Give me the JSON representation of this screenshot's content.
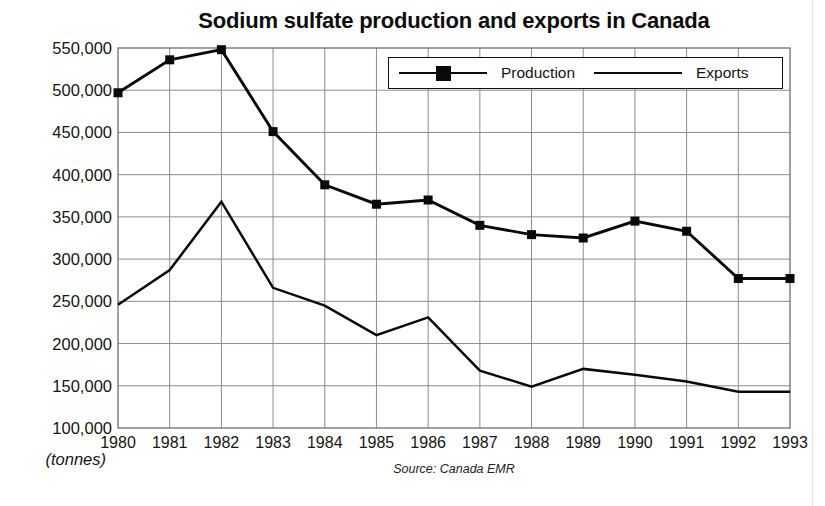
{
  "chart_data": {
    "type": "line",
    "title": "Sodium sulfate production and exports in Canada",
    "xlabel": "",
    "ylabel": "(tonnes)",
    "ylim": [
      100000,
      550000
    ],
    "ytick_step": 50000,
    "grid": true,
    "legend_position": "top-right-inside",
    "source": "Source: Canada EMR",
    "categories": [
      "1980",
      "1981",
      "1982",
      "1983",
      "1984",
      "1985",
      "1986",
      "1987",
      "1988",
      "1989",
      "1990",
      "1991",
      "1992",
      "1993"
    ],
    "x": [
      1980,
      1981,
      1982,
      1983,
      1984,
      1985,
      1986,
      1987,
      1988,
      1989,
      1990,
      1991,
      1992,
      1993
    ],
    "ytick_labels": [
      "550,000",
      "500,000",
      "450,000",
      "400,000",
      "350,000",
      "300,000",
      "250,000",
      "200,000",
      "150,000",
      "100,000"
    ],
    "ytick_values": [
      550000,
      500000,
      450000,
      400000,
      350000,
      300000,
      250000,
      200000,
      150000,
      100000
    ],
    "series": [
      {
        "name": "Production",
        "marker": "filled-square",
        "color": "#0a0a0a",
        "values": [
          497000,
          536000,
          548000,
          451000,
          388000,
          365000,
          370000,
          340000,
          329000,
          325000,
          345000,
          333000,
          277000,
          277000
        ]
      },
      {
        "name": "Exports",
        "marker": "none",
        "color": "#0a0a0a",
        "values": [
          246000,
          287000,
          368000,
          266000,
          245000,
          210000,
          231000,
          168000,
          149000,
          170000,
          163000,
          155000,
          143000,
          143000
        ]
      }
    ]
  },
  "legend": {
    "items": [
      {
        "label": "Production"
      },
      {
        "label": "Exports"
      }
    ]
  },
  "axes": {
    "y_unit_label": "(tonnes)"
  }
}
